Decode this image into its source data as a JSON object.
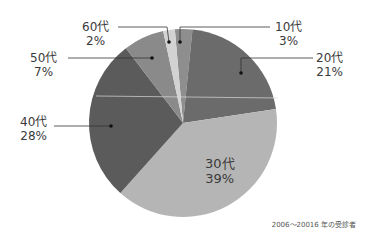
{
  "chart_data": {
    "type": "pie",
    "title": "",
    "start_angle_deg": -5,
    "direction": "clockwise",
    "center": [
      183,
      123
    ],
    "radius": 94,
    "slices": [
      {
        "label": "10代",
        "value": 3,
        "pct_label": "3%",
        "color": "#8e8e8e"
      },
      {
        "label": "20代",
        "value": 21,
        "pct_label": "21%",
        "color": "#6b6b6b"
      },
      {
        "label": "30代",
        "value": 39,
        "pct_label": "39%",
        "color": "#b5b5b5"
      },
      {
        "label": "40代",
        "value": 28,
        "pct_label": "28%",
        "color": "#5b5b5b"
      },
      {
        "label": "50代",
        "value": 7,
        "pct_label": "7%",
        "color": "#8a8a8a"
      },
      {
        "label": "60代",
        "value": 2,
        "pct_label": "2%",
        "color": "#d2d2d2"
      }
    ],
    "footnote": "2006〜20016 年の受診者"
  },
  "labels": {
    "s10": {
      "name": "10代",
      "pct": "3%"
    },
    "s20": {
      "name": "20代",
      "pct": "21%"
    },
    "s30": {
      "name": "30代",
      "pct": "39%"
    },
    "s40": {
      "name": "40代",
      "pct": "28%"
    },
    "s50": {
      "name": "50代",
      "pct": "7%"
    },
    "s60": {
      "name": "60代",
      "pct": "2%"
    }
  },
  "footnote": "2006〜20016 年の受診者"
}
